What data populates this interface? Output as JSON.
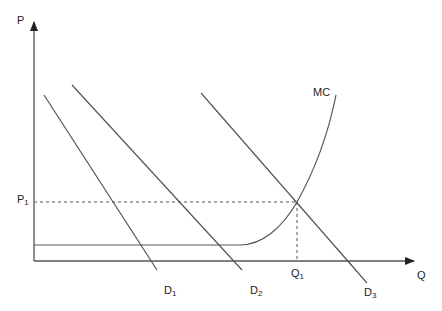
{
  "diagram": {
    "type": "economics-supply-demand",
    "axes": {
      "y_label": "P",
      "x_label": "Q"
    },
    "price_marker": {
      "base": "P",
      "sub": "1"
    },
    "quantity_marker": {
      "base": "Q",
      "sub": "1"
    },
    "curves": [
      {
        "id": "MC",
        "label": "MC",
        "shape": "flat then convex rising"
      },
      {
        "id": "D1",
        "base": "D",
        "sub": "1",
        "shape": "downward sloping line"
      },
      {
        "id": "D2",
        "base": "D",
        "sub": "2",
        "shape": "downward sloping line"
      },
      {
        "id": "D3",
        "base": "D",
        "sub": "3",
        "shape": "downward sloping line"
      }
    ],
    "equilibrium": {
      "curve_pair": [
        "MC",
        "D3"
      ],
      "price": "P1",
      "quantity": "Q1"
    },
    "colors": {
      "line": "#444444",
      "text": "#222222",
      "background": "#ffffff"
    }
  }
}
